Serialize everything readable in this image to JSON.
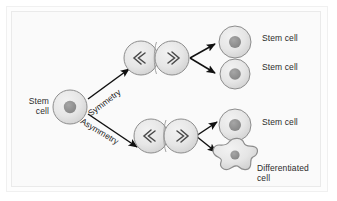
{
  "figure": {
    "background_color": "#fafafa",
    "frame_color": "#eaeaea",
    "cell_fill": "#e8e8e8",
    "cell_stroke": "#888888",
    "nucleus_fill": "#909090",
    "arrow_color": "#111111",
    "text_color": "#2b2b2b"
  },
  "labels": {
    "source_cell": "Stem cell",
    "pathway_symmetric": "Symmetry",
    "pathway_asymmetric": "Asymmetry",
    "daughter_1": "Stem cell",
    "daughter_2": "Stem cell",
    "daughter_3": "Stem cell",
    "daughter_4": "Differentiated cell"
  },
  "nodes": [
    {
      "id": "source-stem-cell",
      "kind": "stem-cell",
      "label": "Stem cell",
      "cx": 70,
      "cy": 107,
      "r": 17
    },
    {
      "id": "dividing-cell-symmetric",
      "kind": "dividing-cell",
      "label": "",
      "cx": 156,
      "cy": 58,
      "r": 17
    },
    {
      "id": "dividing-cell-asymmetric",
      "kind": "dividing-cell",
      "label": "",
      "cx": 166,
      "cy": 136,
      "r": 17
    },
    {
      "id": "daughter-stem-cell-1",
      "kind": "stem-cell",
      "label": "Stem cell",
      "cx": 235,
      "cy": 42,
      "r": 16
    },
    {
      "id": "daughter-stem-cell-2",
      "kind": "stem-cell",
      "label": "Stem cell",
      "cx": 235,
      "cy": 74,
      "r": 15
    },
    {
      "id": "daughter-stem-cell-3",
      "kind": "stem-cell",
      "label": "Stem cell",
      "cx": 235,
      "cy": 125,
      "r": 16
    },
    {
      "id": "daughter-differentiated-cell",
      "kind": "differentiated-cell",
      "label": "Differentiated cell",
      "cx": 236,
      "cy": 160,
      "r": 20
    }
  ],
  "edges": [
    {
      "id": "edge-symmetry",
      "from": "source-stem-cell",
      "to": "dividing-cell-symmetric",
      "label": "Symmetry"
    },
    {
      "id": "edge-asymmetry",
      "from": "source-stem-cell",
      "to": "dividing-cell-asymmetric",
      "label": "Asymmetry"
    },
    {
      "id": "edge-sym-daughter-1",
      "from": "dividing-cell-symmetric",
      "to": "daughter-stem-cell-1",
      "label": ""
    },
    {
      "id": "edge-sym-daughter-2",
      "from": "dividing-cell-symmetric",
      "to": "daughter-stem-cell-2",
      "label": ""
    },
    {
      "id": "edge-asym-daughter-1",
      "from": "dividing-cell-asymmetric",
      "to": "daughter-stem-cell-3",
      "label": ""
    },
    {
      "id": "edge-asym-daughter-2",
      "from": "dividing-cell-asymmetric",
      "to": "daughter-differentiated-cell",
      "label": ""
    }
  ]
}
